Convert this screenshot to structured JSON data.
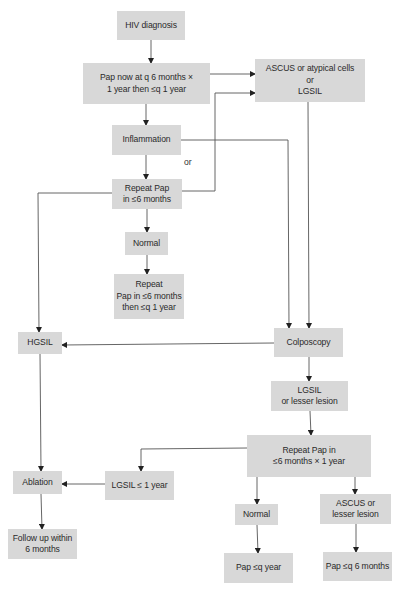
{
  "diagram": {
    "type": "flowchart",
    "box_fill": "#d8d8d8",
    "line_color": "#555555",
    "nodes": {
      "hiv_diagnosis": "HIV diagnosis",
      "pap_now": "Pap now at q 6 months ×\n1 year then ≤q 1 year",
      "ascus_lgsil": "ASCUS or atypical cells\nor\nLGSIL",
      "inflammation": "Inflammation",
      "repeat_pap_6mo": "Repeat Pap\nin ≤6 months",
      "normal_top": "Normal",
      "repeat_pap_then_year": "Repeat\nPap in ≤6 months\nthen ≤q 1 year",
      "hgsil": "HGSIL",
      "colposcopy": "Colposcopy",
      "lgsil_lesser": "LGSIL\nor lesser lesion",
      "repeat_pap_1yr": "Repeat Pap in\n≤6 months × 1 year",
      "ablation": "Ablation",
      "lgsil_le_1yr": "LGSIL ≤ 1 year",
      "follow_up": "Follow up within\n6 months",
      "normal_bottom": "Normal",
      "ascus_lesser": "ASCUS or\nlesser lesion",
      "pap_q_year": "Pap ≤q year",
      "pap_q_6mo": "Pap ≤q 6 months"
    },
    "annotations": {
      "or": "or"
    },
    "edges": [
      [
        "hiv_diagnosis",
        "pap_now"
      ],
      [
        "pap_now",
        "ascus_lgsil"
      ],
      [
        "pap_now",
        "inflammation"
      ],
      [
        "inflammation",
        "repeat_pap_6mo"
      ],
      [
        "inflammation",
        "colposcopy"
      ],
      [
        "repeat_pap_6mo",
        "ascus_lgsil"
      ],
      [
        "repeat_pap_6mo",
        "hgsil"
      ],
      [
        "repeat_pap_6mo",
        "normal_top"
      ],
      [
        "normal_top",
        "repeat_pap_then_year"
      ],
      [
        "ascus_lgsil",
        "colposcopy"
      ],
      [
        "colposcopy",
        "hgsil"
      ],
      [
        "colposcopy",
        "lgsil_lesser"
      ],
      [
        "lgsil_lesser",
        "repeat_pap_1yr"
      ],
      [
        "repeat_pap_1yr",
        "lgsil_le_1yr"
      ],
      [
        "repeat_pap_1yr",
        "normal_bottom"
      ],
      [
        "repeat_pap_1yr",
        "ascus_lesser"
      ],
      [
        "lgsil_le_1yr",
        "ablation"
      ],
      [
        "hgsil",
        "ablation"
      ],
      [
        "ablation",
        "follow_up"
      ],
      [
        "normal_bottom",
        "pap_q_year"
      ],
      [
        "ascus_lesser",
        "pap_q_6mo"
      ]
    ]
  }
}
